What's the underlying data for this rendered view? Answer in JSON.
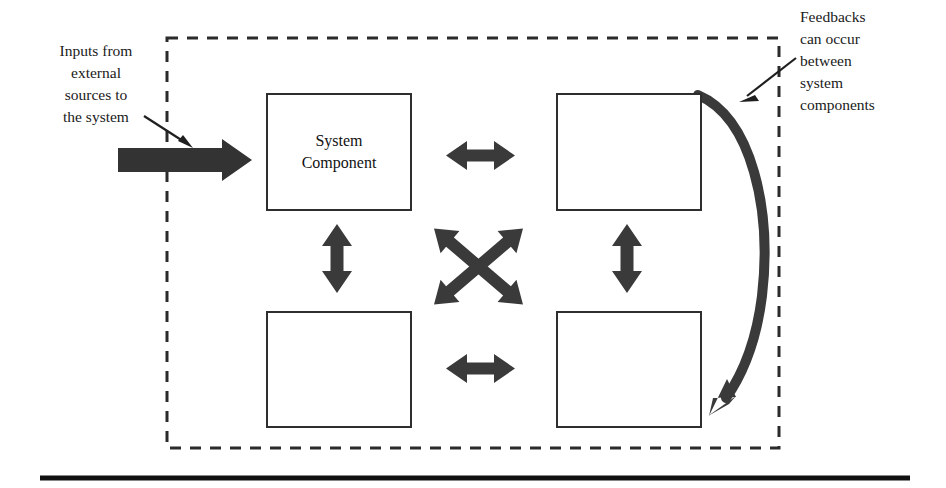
{
  "diagram": {
    "boundary": {
      "name": "system-boundary",
      "style": "dashed",
      "color": "#2b2b2b"
    },
    "annotations": {
      "input": {
        "text": "Inputs  from\nexternal\nsources to\nthe system",
        "align": "center"
      },
      "feedback": {
        "text": "Feedbacks\ncan occur\nbetween\nsystem\ncomponents",
        "align": "left"
      }
    },
    "boxes": [
      {
        "id": "box-top-left",
        "label": "System\nComponent"
      },
      {
        "id": "box-top-right",
        "label": ""
      },
      {
        "id": "box-bottom-left",
        "label": ""
      },
      {
        "id": "box-bottom-right",
        "label": ""
      }
    ],
    "connectors": [
      {
        "name": "input-flow-arrow",
        "kind": "thick-single-arrow",
        "direction": "right"
      },
      {
        "name": "input-pointer-arrow",
        "kind": "thin-single-arrow",
        "direction": "down-right"
      },
      {
        "name": "top-horizontal-arrow",
        "kind": "double-arrow",
        "direction": "horizontal"
      },
      {
        "name": "bottom-horizontal-arrow",
        "kind": "double-arrow",
        "direction": "horizontal"
      },
      {
        "name": "left-vertical-arrow",
        "kind": "double-arrow",
        "direction": "vertical"
      },
      {
        "name": "right-vertical-arrow",
        "kind": "double-arrow",
        "direction": "vertical"
      },
      {
        "name": "diagonal-arrow-nw-se",
        "kind": "double-arrow",
        "direction": "diagonal"
      },
      {
        "name": "diagonal-arrow-ne-sw",
        "kind": "double-arrow",
        "direction": "diagonal"
      },
      {
        "name": "feedback-curved-arrow",
        "kind": "curved-single-arrow",
        "direction": "down"
      },
      {
        "name": "feedback-pointer-arrow",
        "kind": "thin-single-arrow",
        "direction": "down-left"
      }
    ],
    "rule": {
      "name": "footer-rule",
      "color": "#111111"
    },
    "colors": {
      "arrow_fill": "#3a3a3a",
      "box_stroke": "#2e2e2e",
      "boundary_stroke": "#2b2b2b",
      "text": "#1a1a1a",
      "background": "#ffffff"
    }
  }
}
